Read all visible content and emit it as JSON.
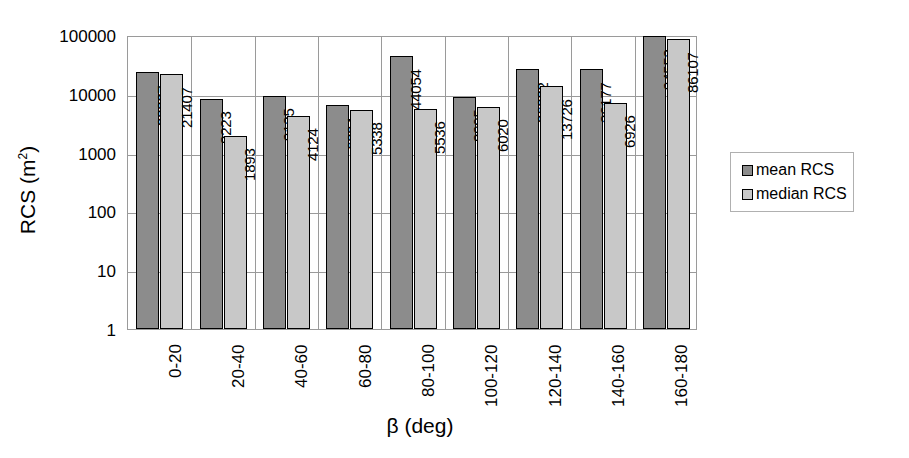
{
  "chart_data": {
    "type": "bar",
    "title": "",
    "xlabel": "β (deg)",
    "ylabel": "RCS (m²)",
    "ylabel_base": "RCS (m",
    "ylabel_sup": "2",
    "ylabel_tail": ")",
    "yscale": "log",
    "ylim": [
      1,
      100000
    ],
    "grid": true,
    "legend_position": "right",
    "categories": [
      "0-20",
      "20-40",
      "40-60",
      "60-80",
      "80-100",
      "100-120",
      "120-140",
      "140-160",
      "160-180"
    ],
    "y_ticks": [
      "100000",
      "10000",
      "1000",
      "100",
      "10",
      "1"
    ],
    "y_tick_values": [
      100000,
      10000,
      1000,
      100,
      10,
      1
    ],
    "series": [
      {
        "name": "mean RCS",
        "color": "#8c8c8c",
        "values": [
          23327,
          8223,
          9125,
          6394,
          44054,
          8905,
          26232,
          26177,
          94552
        ]
      },
      {
        "name": "median RCS",
        "color": "#c8c8c8",
        "values": [
          21407,
          1893,
          4124,
          5338,
          5536,
          6020,
          13726,
          6926,
          86107
        ]
      }
    ],
    "data_labels": [
      [
        "23327",
        "21407"
      ],
      [
        "8223",
        "1893"
      ],
      [
        "9125",
        "4124"
      ],
      [
        "6394",
        "5338"
      ],
      [
        "44054",
        "5536"
      ],
      [
        "8905",
        "6020"
      ],
      [
        "26232",
        "13726"
      ],
      [
        "26177",
        "6926"
      ],
      [
        "94552",
        "86107"
      ]
    ]
  },
  "legend": {
    "items": [
      {
        "label": "mean RCS",
        "color": "#8c8c8c"
      },
      {
        "label": "median RCS",
        "color": "#c8c8c8"
      }
    ]
  }
}
